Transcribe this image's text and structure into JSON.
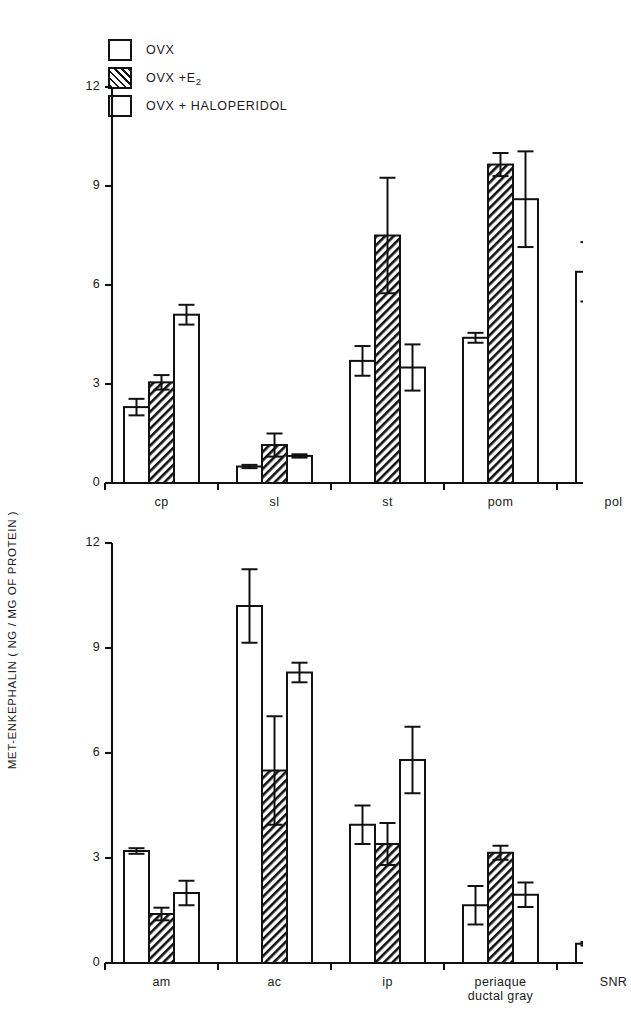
{
  "figure": {
    "ylabel": "MET-ENKEPHALIN ( NG / MG OF PROTEIN )",
    "legend": [
      {
        "key": "ovx",
        "label": "OVX",
        "fill": "open"
      },
      {
        "key": "ovx_e2",
        "label": "OVX +E",
        "sub": "2",
        "fill": "hatched"
      },
      {
        "key": "ovx_hal",
        "label": "OVX + HALOPERIDOL",
        "fill": "open"
      }
    ]
  },
  "chart_data": [
    {
      "type": "bar",
      "panel": "top",
      "title": "",
      "xlabel": "",
      "ylabel": "MET-ENKEPHALIN ( NG / MG OF PROTEIN )",
      "ylim": [
        0,
        12
      ],
      "yticks": [
        0,
        3,
        6,
        9,
        12
      ],
      "grid": false,
      "legend_position": "upper-left",
      "categories": [
        "cp",
        "sl",
        "st",
        "pom",
        "pol"
      ],
      "series": [
        {
          "name": "OVX",
          "fill": "open",
          "values": [
            2.3,
            0.5,
            3.7,
            4.4,
            6.4
          ],
          "errors": [
            0.25,
            0.05,
            0.45,
            0.15,
            0.9
          ]
        },
        {
          "name": "OVX + E2",
          "fill": "hatched",
          "values": [
            3.05,
            1.15,
            7.5,
            9.65,
            10.15
          ],
          "errors": [
            0.22,
            0.35,
            1.75,
            0.35,
            0.55
          ]
        },
        {
          "name": "OVX + HALOPERIDOL",
          "fill": "open",
          "values": [
            5.1,
            0.82,
            3.5,
            8.6,
            13.45
          ],
          "errors": [
            0.3,
            0.05,
            0.7,
            1.45,
            1.45
          ]
        }
      ]
    },
    {
      "type": "bar",
      "panel": "bottom",
      "title": "",
      "xlabel": "",
      "ylabel": "MET-ENKEPHALIN ( NG / MG OF PROTEIN )",
      "ylim": [
        0,
        12
      ],
      "yticks": [
        0,
        3,
        6,
        9,
        12
      ],
      "grid": false,
      "categories": [
        "am",
        "ac",
        "ip",
        "periaque ductal gray",
        "SNR"
      ],
      "category_lines": [
        [
          "am"
        ],
        [
          "ac"
        ],
        [
          "ip"
        ],
        [
          "periaque",
          "ductal gray"
        ],
        [
          "SNR"
        ]
      ],
      "series": [
        {
          "name": "OVX",
          "fill": "open",
          "values": [
            3.2,
            10.2,
            3.95,
            1.65,
            0.55
          ],
          "errors": [
            0.08,
            1.05,
            0.55,
            0.55,
            0.05
          ]
        },
        {
          "name": "OVX + E2",
          "fill": "hatched",
          "values": [
            1.4,
            5.5,
            3.4,
            3.15,
            0.65
          ],
          "errors": [
            0.18,
            1.55,
            0.6,
            0.2,
            0.18
          ]
        },
        {
          "name": "OVX + HALOPERIDOL",
          "fill": "open",
          "values": [
            2.0,
            8.3,
            5.8,
            1.95,
            0.8
          ],
          "errors": [
            0.35,
            0.28,
            0.95,
            0.35,
            0.05
          ]
        }
      ]
    }
  ]
}
